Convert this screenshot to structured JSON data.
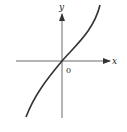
{
  "figure": {
    "x_axis_label": "x",
    "y_axis_label": "y",
    "origin_label": "0",
    "curve_description": "increasing S-shaped curve passing through origin, concave down for x<0 and concave up for x>0",
    "colors": {
      "axes": "#333333",
      "curve": "#333333",
      "background": "#ffffff"
    }
  }
}
